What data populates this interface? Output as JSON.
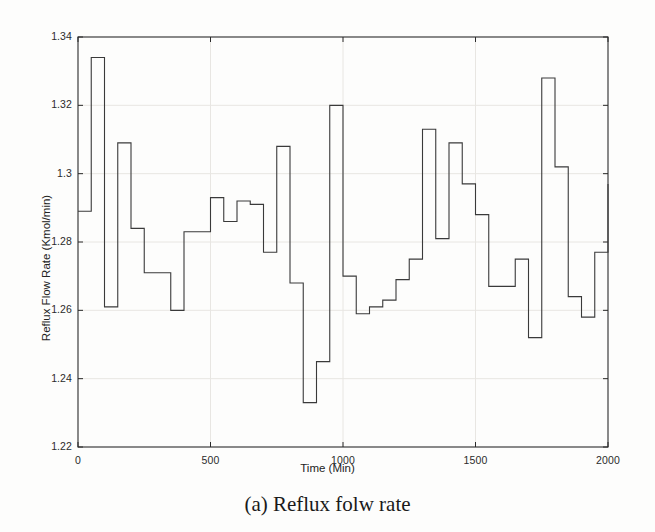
{
  "caption": "(a) Reflux folw rate",
  "axes": {
    "xlabel": "Time (Min)",
    "ylabel": "Reflux Flow Rate (Kmol/min)",
    "xticks": [
      "0",
      "500",
      "1000",
      "1500",
      "2000"
    ],
    "yticks": [
      "1.34",
      "1.32",
      "1.3",
      "1.28",
      "1.26",
      "1.24",
      "1.22"
    ]
  },
  "style": {
    "line_color": "#3a3a3a",
    "frame_color": "#2a2a2a",
    "grid_color": "#e8e6e2",
    "background": "#fdfdfc"
  },
  "chart_data": {
    "type": "line",
    "subtype": "step-post",
    "title": "",
    "xlabel": "Time (Min)",
    "ylabel": "Reflux Flow Rate (Kmol/min)",
    "xlim": [
      0,
      2000
    ],
    "ylim": [
      1.22,
      1.34
    ],
    "xticks": [
      0,
      500,
      1000,
      1500,
      2000
    ],
    "yticks": [
      1.34,
      1.32,
      1.3,
      1.28,
      1.26,
      1.24,
      1.22
    ],
    "grid": true,
    "legend": null,
    "step_width": 50,
    "x": [
      0,
      50,
      100,
      150,
      200,
      250,
      300,
      350,
      400,
      450,
      500,
      550,
      600,
      650,
      700,
      750,
      800,
      850,
      900,
      950,
      1000,
      1050,
      1100,
      1150,
      1200,
      1250,
      1300,
      1350,
      1400,
      1450,
      1500,
      1550,
      1600,
      1650,
      1700,
      1750,
      1800,
      1850,
      1900,
      1950,
      2000
    ],
    "series": [
      {
        "name": "Reflux Flow Rate",
        "values": [
          1.289,
          1.334,
          1.261,
          1.309,
          1.284,
          1.271,
          1.271,
          1.26,
          1.283,
          1.283,
          1.293,
          1.286,
          1.292,
          1.291,
          1.277,
          1.308,
          1.268,
          1.233,
          1.245,
          1.32,
          1.27,
          1.259,
          1.261,
          1.263,
          1.269,
          1.275,
          1.313,
          1.281,
          1.309,
          1.297,
          1.288,
          1.267,
          1.267,
          1.275,
          1.252,
          1.328,
          1.302,
          1.264,
          1.258,
          1.277,
          1.297
        ]
      }
    ]
  }
}
